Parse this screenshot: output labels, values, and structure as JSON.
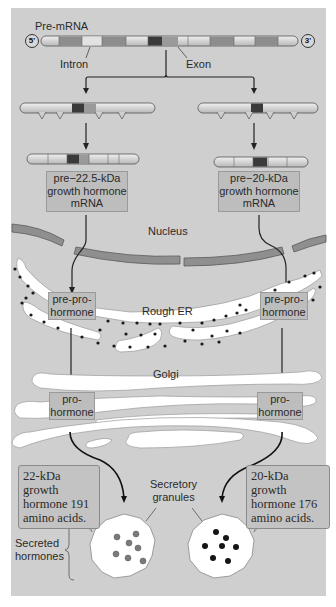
{
  "figure": {
    "premrna_label": "Pre-mRNA",
    "five_prime": "5'",
    "three_prime": "3'",
    "intron_label": "Intron",
    "exon_label": "Exon",
    "left_mrna_label": [
      "pre−22.5-kDa",
      "growth hormone",
      "mRNA"
    ],
    "right_mrna_label": [
      "pre−20-kDa",
      "growth hormone",
      "mRNA"
    ],
    "nucleus_label": "Nucleus",
    "rough_er_label": "Rough ER",
    "left_preprohormone": [
      "pre-pro-",
      "hormone"
    ],
    "right_preprohormone": [
      "pre-pro-",
      "hormone"
    ],
    "golgi_label": "Golgi",
    "left_prohormone": [
      "pro-",
      "hormone"
    ],
    "right_prohormone": [
      "pro-",
      "hormone"
    ],
    "left_callout": [
      "22-kDa growth",
      "hormone 191",
      "amino acids."
    ],
    "right_callout": [
      "20-kDa growth",
      "hormone 176",
      "amino acids."
    ],
    "granules_label": [
      "Secretory",
      "granules"
    ],
    "secreted_label": [
      "Secreted",
      "hormones"
    ]
  },
  "colors": {
    "background": "#cfcfcf",
    "exon_dark": "#8a8a8a",
    "exon_darkest": "#3a3a3a",
    "intron_light": "#e4e4e4",
    "membrane": "#9a9a9a",
    "organelle": "#ffffff",
    "ribosome": "#1a1a1a",
    "granule_22kda_dots": "#7a7a7a",
    "granule_20kda_dots": "#151515"
  },
  "premrna_segments": [
    "cap",
    "dark",
    "light",
    "dark",
    "light",
    "darkest",
    "dark",
    "light",
    "dark",
    "light",
    "dark",
    "cap"
  ],
  "left_spliced_segments": [
    "cap",
    "light",
    "darkest",
    "light",
    "cap"
  ],
  "right_spliced_segments": [
    "cap",
    "light",
    "darkest",
    "light",
    "cap"
  ]
}
